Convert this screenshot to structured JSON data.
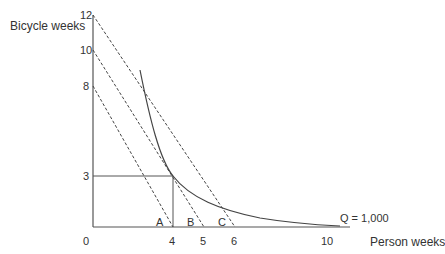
{
  "diagram": {
    "y_axis_label": "Bicycle weeks",
    "x_axis_label": "Person weeks",
    "y_ticks": [
      {
        "label": "12",
        "x": 80,
        "y": 10
      },
      {
        "label": "10",
        "x": 80,
        "y": 45
      },
      {
        "label": "8",
        "x": 83,
        "y": 81
      },
      {
        "label": "3",
        "x": 83,
        "y": 171
      },
      {
        "label": "0",
        "x": 83,
        "y": 236
      }
    ],
    "x_ticks": [
      {
        "label": "4",
        "x": 169,
        "y": 236
      },
      {
        "label": "5",
        "x": 200,
        "y": 236
      },
      {
        "label": "6",
        "x": 231,
        "y": 236
      },
      {
        "label": "10",
        "x": 321,
        "y": 236
      }
    ],
    "points": [
      {
        "label": "A",
        "x": 156,
        "y": 217
      },
      {
        "label": "B",
        "x": 187,
        "y": 217
      },
      {
        "label": "C",
        "x": 218,
        "y": 217
      }
    ],
    "isoquant_label": "Q = 1,000",
    "colors": {
      "axis": "#555555",
      "line": "#444444"
    }
  }
}
